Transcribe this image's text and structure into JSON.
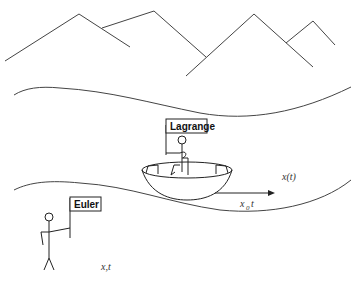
{
  "diagram": {
    "labels": {
      "lagrange_flag": "Lagrange",
      "euler_flag": "Euler",
      "trajectory": "x(t)",
      "displacement_main": "x",
      "displacement_sub": "0",
      "displacement_suffix": "t",
      "euler_coords": "x,t"
    },
    "elements": [
      {
        "id": "mountains",
        "type": "polyline"
      },
      {
        "id": "river-upper-bank",
        "type": "curve"
      },
      {
        "id": "river-lower-bank",
        "type": "curve"
      },
      {
        "id": "boat",
        "type": "shape"
      },
      {
        "id": "lagrange-observer",
        "type": "stick-figure",
        "in_boat": true
      },
      {
        "id": "euler-observer",
        "type": "stick-figure",
        "on_bank": true
      },
      {
        "id": "flow-arrow",
        "type": "arrow",
        "direction": "right"
      }
    ],
    "colors": {
      "stroke": "#444444",
      "text": "#111111",
      "background": "#ffffff"
    }
  }
}
